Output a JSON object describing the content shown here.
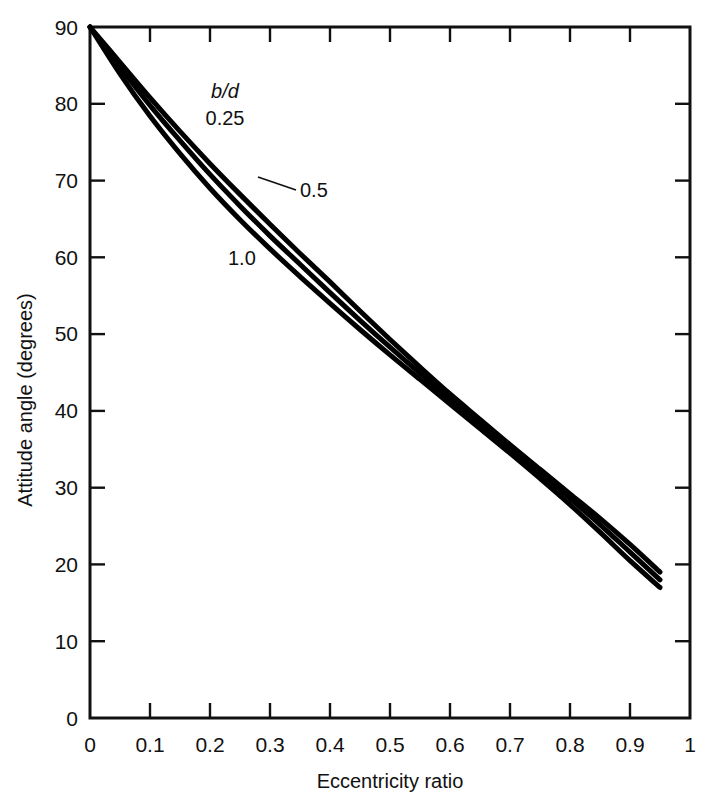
{
  "chart_data": {
    "type": "line",
    "title": "",
    "xlabel": "Eccentricity ratio",
    "ylabel": "Attitude angle (degrees)",
    "xlim": [
      0,
      1
    ],
    "ylim": [
      0,
      90
    ],
    "grid": false,
    "legend_position": "inline-labels",
    "series_key_label": "b/d",
    "xticks": [
      0,
      0.1,
      0.2,
      0.3,
      0.4,
      0.5,
      0.6,
      0.7,
      0.8,
      0.9,
      1
    ],
    "xtick_labels": [
      "0",
      "0.1",
      "0.2",
      "0.3",
      "0.4",
      "0.5",
      "0.6",
      "0.7",
      "0.8",
      "0.9",
      "1"
    ],
    "yticks": [
      0,
      10,
      20,
      30,
      40,
      50,
      60,
      70,
      80,
      90
    ],
    "ytick_labels": [
      "0",
      "10",
      "20",
      "30",
      "40",
      "50",
      "60",
      "70",
      "80",
      "90"
    ],
    "line_color": "#000000",
    "series": [
      {
        "name": "0.25",
        "label": "0.25",
        "x": [
          0,
          0.05,
          0.1,
          0.15,
          0.2,
          0.25,
          0.3,
          0.35,
          0.4,
          0.45,
          0.5,
          0.55,
          0.6,
          0.65,
          0.7,
          0.75,
          0.8,
          0.85,
          0.9,
          0.95
        ],
        "values": [
          90,
          85.4,
          80.8,
          76.4,
          72.2,
          68.2,
          64.3,
          60.5,
          56.8,
          53.0,
          49.3,
          45.7,
          42.2,
          38.9,
          35.6,
          32.4,
          29.2,
          26.0,
          22.6,
          19.0
        ]
      },
      {
        "name": "0.5",
        "label": "0.5",
        "x": [
          0,
          0.05,
          0.1,
          0.15,
          0.2,
          0.25,
          0.3,
          0.35,
          0.4,
          0.45,
          0.5,
          0.55,
          0.6,
          0.65,
          0.7,
          0.75,
          0.8,
          0.85,
          0.9,
          0.95
        ],
        "values": [
          90,
          84.8,
          79.8,
          75.2,
          70.8,
          66.7,
          62.8,
          59.1,
          55.4,
          51.8,
          48.3,
          44.9,
          41.6,
          38.3,
          35.1,
          31.9,
          28.6,
          25.2,
          21.6,
          18.0
        ]
      },
      {
        "name": "1.0",
        "label": "1.0",
        "x": [
          0,
          0.05,
          0.1,
          0.15,
          0.2,
          0.25,
          0.3,
          0.35,
          0.4,
          0.45,
          0.5,
          0.55,
          0.6,
          0.65,
          0.7,
          0.75,
          0.8,
          0.85,
          0.9,
          0.95
        ],
        "values": [
          90,
          83.9,
          78.4,
          73.5,
          69.0,
          64.9,
          61.1,
          57.5,
          54.0,
          50.6,
          47.3,
          44.1,
          40.9,
          37.7,
          34.5,
          31.2,
          27.8,
          24.2,
          20.5,
          17.0
        ]
      }
    ],
    "annotations": [
      {
        "text": "b/d",
        "italic": true,
        "x_px": 225,
        "y_px": 98
      },
      {
        "text": "0.25",
        "italic": false,
        "x_px": 222,
        "y_px": 125
      },
      {
        "text": "0.5",
        "italic": false,
        "x_px": 300,
        "y_px": 196
      },
      {
        "text": "1.0",
        "italic": false,
        "x_px": 243,
        "y_px": 264
      }
    ]
  }
}
